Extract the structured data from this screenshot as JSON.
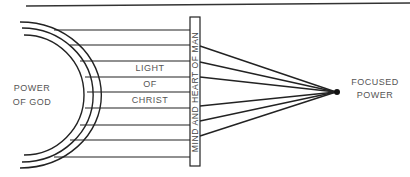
{
  "diagram": {
    "source_label_line1": "POWER",
    "source_label_line2": "OF GOD",
    "channel_label_line1": "LIGHT",
    "channel_label_line2": "OF",
    "channel_label_line3": "CHRIST",
    "lens_label": "MIND AND HEART OF MAN",
    "target_label_line1": "FOCUSED",
    "target_label_line2": "POWER",
    "line_color": "#222222",
    "text_color": "#555555"
  }
}
